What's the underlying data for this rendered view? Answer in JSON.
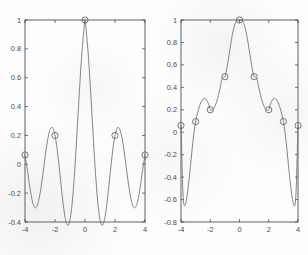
{
  "page": {
    "background_color": "#fdfdfd",
    "axis_color": "#3b3b3b",
    "curve_color": "#6e6e74",
    "marker_color": "#5f5f66",
    "label_color": "#4a4a50"
  },
  "chart_data": [
    {
      "id": "left",
      "type": "line",
      "title": "",
      "xlabel": "",
      "ylabel": "",
      "xlim": [
        -4,
        4
      ],
      "ylim": [
        -0.4,
        1
      ],
      "grid": false,
      "legend": "none",
      "xticks": [
        -4,
        -2,
        0,
        2,
        4
      ],
      "xticklabels": [
        "-4",
        "-2",
        "0",
        "2",
        "4"
      ],
      "yticks": [
        -0.4,
        -0.2,
        0,
        0.2,
        0.4,
        0.6,
        0.8,
        1
      ],
      "yticklabels": [
        "-0.4",
        "-0.2",
        "0",
        "0.2",
        "0.4",
        "0.6",
        "0.8",
        "1"
      ],
      "series": [
        {
          "name": "interpolated-curve",
          "style": "solid-line",
          "note": "smooth sinc-like lobe peaking at x=0, y=1 with side lobes dipping to about -0.3 near x=+/-3.3",
          "x": [
            -4.0,
            -3.9,
            -3.8,
            -3.7,
            -3.6,
            -3.5,
            -3.4,
            -3.3,
            -3.2,
            -3.1,
            -3.0,
            -2.9,
            -2.8,
            -2.7,
            -2.6,
            -2.5,
            -2.4,
            -2.3,
            -2.2,
            -2.1,
            -2.0,
            -1.9,
            -1.8,
            -1.7,
            -1.6,
            -1.5,
            -1.4,
            -1.3,
            -1.2,
            -1.1,
            -1.0,
            -0.9,
            -0.8,
            -0.7,
            -0.6,
            -0.5,
            -0.4,
            -0.3,
            -0.2,
            -0.1,
            0.0,
            0.1,
            0.2,
            0.3,
            0.4,
            0.5,
            0.6,
            0.7,
            0.8,
            0.9,
            1.0,
            1.1,
            1.2,
            1.3,
            1.4,
            1.5,
            1.6,
            1.7,
            1.8,
            1.9,
            2.0,
            2.1,
            2.2,
            2.3,
            2.4,
            2.5,
            2.6,
            2.7,
            2.8,
            2.9,
            3.0,
            3.1,
            3.2,
            3.3,
            3.4,
            3.5,
            3.6,
            3.7,
            3.8,
            3.9,
            4.0
          ],
          "y": [
            0.065,
            0.0,
            -0.07,
            -0.145,
            -0.21,
            -0.26,
            -0.292,
            -0.302,
            -0.29,
            -0.257,
            -0.205,
            -0.138,
            -0.062,
            0.018,
            0.095,
            0.163,
            0.215,
            0.247,
            0.256,
            0.241,
            0.2,
            0.137,
            0.055,
            -0.04,
            -0.14,
            -0.236,
            -0.32,
            -0.383,
            -0.418,
            -0.42,
            -0.385,
            -0.312,
            -0.203,
            -0.063,
            0.101,
            0.279,
            0.46,
            0.632,
            0.783,
            0.903,
            1.0,
            0.903,
            0.783,
            0.632,
            0.46,
            0.279,
            0.101,
            -0.063,
            -0.203,
            -0.312,
            -0.385,
            -0.42,
            -0.418,
            -0.383,
            -0.32,
            -0.236,
            -0.14,
            -0.04,
            0.055,
            0.137,
            0.2,
            0.241,
            0.256,
            0.247,
            0.215,
            0.163,
            0.095,
            0.018,
            -0.062,
            -0.138,
            -0.205,
            -0.257,
            -0.29,
            -0.302,
            -0.292,
            -0.26,
            -0.21,
            -0.145,
            -0.07,
            0.0,
            0.065
          ]
        },
        {
          "name": "sample-markers",
          "style": "open-circle-markers",
          "x": [
            -4,
            -2,
            0,
            2,
            4
          ],
          "y": [
            0.065,
            0.2,
            1.0,
            0.2,
            0.065
          ]
        }
      ]
    },
    {
      "id": "right",
      "type": "line",
      "title": "",
      "xlabel": "",
      "ylabel": "",
      "xlim": [
        -4,
        4
      ],
      "ylim": [
        -0.8,
        1
      ],
      "grid": false,
      "legend": "none",
      "xticks": [
        -4,
        -2,
        0,
        2,
        4
      ],
      "xticklabels": [
        "-4",
        "-2",
        "0",
        "2",
        "4"
      ],
      "yticks": [
        -0.8,
        -0.6,
        -0.4,
        -0.2,
        0,
        0.2,
        0.4,
        0.6,
        0.8,
        1
      ],
      "yticklabels": [
        "-0.8",
        "-0.6",
        "-0.4",
        "-0.2",
        "0",
        "0.2",
        "0.4",
        "0.6",
        "0.8",
        "1"
      ],
      "series": [
        {
          "name": "interpolated-curve",
          "style": "solid-line",
          "note": "narrow main lobe peaking at x=0, y=1, shoulders near 0.3 around x=+/-2.5, plunging to about -0.65 at the edges",
          "x": [
            -4.0,
            -3.95,
            -3.9,
            -3.85,
            -3.8,
            -3.75,
            -3.7,
            -3.6,
            -3.5,
            -3.4,
            -3.3,
            -3.2,
            -3.1,
            -3.0,
            -2.9,
            -2.8,
            -2.7,
            -2.6,
            -2.5,
            -2.4,
            -2.3,
            -2.2,
            -2.1,
            -2.0,
            -1.9,
            -1.8,
            -1.7,
            -1.6,
            -1.5,
            -1.4,
            -1.3,
            -1.2,
            -1.1,
            -1.0,
            -0.9,
            -0.8,
            -0.7,
            -0.6,
            -0.5,
            -0.4,
            -0.3,
            -0.2,
            -0.1,
            0.0,
            0.1,
            0.2,
            0.3,
            0.4,
            0.5,
            0.6,
            0.7,
            0.8,
            0.9,
            1.0,
            1.1,
            1.2,
            1.3,
            1.4,
            1.5,
            1.6,
            1.7,
            1.8,
            1.9,
            2.0,
            2.1,
            2.2,
            2.3,
            2.4,
            2.5,
            2.6,
            2.7,
            2.8,
            2.9,
            3.0,
            3.1,
            3.2,
            3.3,
            3.4,
            3.5,
            3.6,
            3.7,
            3.75,
            3.8,
            3.85,
            3.9,
            3.95,
            4.0
          ],
          "y": [
            0.06,
            -0.18,
            -0.42,
            -0.58,
            -0.645,
            -0.655,
            -0.645,
            -0.58,
            -0.48,
            -0.36,
            -0.23,
            -0.1,
            0.01,
            0.095,
            0.155,
            0.205,
            0.245,
            0.275,
            0.295,
            0.302,
            0.295,
            0.275,
            0.245,
            0.2,
            0.196,
            0.205,
            0.225,
            0.258,
            0.3,
            0.352,
            0.41,
            0.472,
            0.49,
            0.495,
            0.545,
            0.62,
            0.7,
            0.785,
            0.862,
            0.923,
            0.967,
            0.992,
            1.0,
            1.0,
            1.0,
            0.992,
            0.967,
            0.923,
            0.862,
            0.785,
            0.7,
            0.62,
            0.545,
            0.495,
            0.49,
            0.472,
            0.41,
            0.352,
            0.3,
            0.258,
            0.225,
            0.205,
            0.196,
            0.2,
            0.245,
            0.275,
            0.295,
            0.302,
            0.295,
            0.275,
            0.245,
            0.205,
            0.155,
            0.095,
            0.01,
            -0.1,
            -0.23,
            -0.36,
            -0.48,
            -0.58,
            -0.645,
            -0.655,
            -0.645,
            -0.58,
            -0.42,
            -0.18,
            0.06
          ]
        },
        {
          "name": "sample-markers",
          "style": "open-circle-markers",
          "x": [
            -4,
            -3,
            -2,
            -1,
            0,
            1,
            2,
            3,
            4
          ],
          "y": [
            0.06,
            0.095,
            0.2,
            0.495,
            1.0,
            0.495,
            0.2,
            0.095,
            0.06
          ]
        }
      ]
    }
  ]
}
